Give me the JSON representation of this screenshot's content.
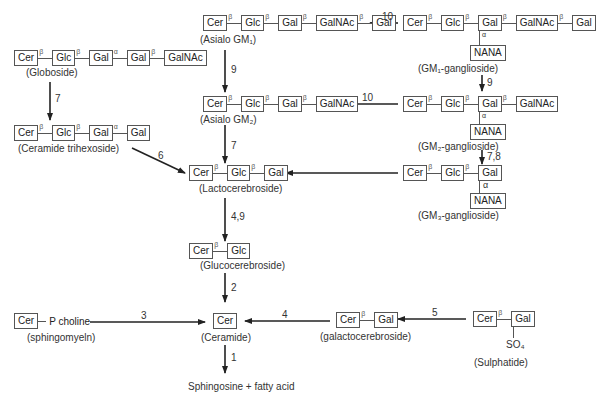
{
  "compounds": {
    "globoside": {
      "units": [
        "Cer",
        "Glc",
        "Gal",
        "Gal",
        "GalNAc"
      ],
      "links": [
        "β",
        "β",
        "α",
        "β"
      ],
      "label": "(Globoside)"
    },
    "ceramide_trihexoside": {
      "units": [
        "Cer",
        "Glc",
        "Gal",
        "Gal"
      ],
      "links": [
        "β",
        "β",
        "α"
      ],
      "label": "(Ceramide trihexoside)"
    },
    "asialo_gm1": {
      "units": [
        "Cer",
        "Glc",
        "Gal",
        "GalNAc",
        "Gal"
      ],
      "links": [
        "β",
        "β",
        "β",
        "β"
      ],
      "label": "(Asialo GM₁)"
    },
    "asialo_gm2": {
      "units": [
        "Cer",
        "Glc",
        "Gal",
        "GalNAc"
      ],
      "links": [
        "β",
        "β",
        "β"
      ],
      "label": "(Asialo GM₂)"
    },
    "gm1": {
      "units": [
        "Cer",
        "Glc",
        "Gal",
        "GalNAc",
        "Gal"
      ],
      "links": [
        "β",
        "β",
        "β",
        "β"
      ],
      "branch": "NANA",
      "branch_link": "α",
      "label": "(GM₁-ganglioside)"
    },
    "gm2": {
      "units": [
        "Cer",
        "Glc",
        "Gal",
        "GalNAc"
      ],
      "links": [
        "β",
        "β",
        "β"
      ],
      "branch": "NANA",
      "branch_link": "α",
      "label": "(GM₂-ganglioside)"
    },
    "gm3": {
      "units": [
        "Cer",
        "Glc",
        "Gal"
      ],
      "links": [
        "β",
        "β"
      ],
      "branch": "NANA",
      "branch_link": "α",
      "label": "(GM₃-ganglioside)"
    },
    "lactocerebroside": {
      "units": [
        "Cer",
        "Glc",
        "Gal"
      ],
      "links": [
        "β",
        "β"
      ],
      "label": "(Lactocerebroside)"
    },
    "glucocerebroside": {
      "units": [
        "Cer",
        "Glc"
      ],
      "links": [
        "β"
      ],
      "label": "(Glucocerebroside)"
    },
    "ceramide": {
      "units": [
        "Cer"
      ],
      "label": "(Ceramide)"
    },
    "sphingomyelin": {
      "units": [
        "Cer"
      ],
      "tail": "P choline",
      "label": "(sphingomyeln)"
    },
    "galactocerebroside": {
      "units": [
        "Cer",
        "Gal"
      ],
      "links": [
        "β"
      ],
      "label": "(galactocerebroside)"
    },
    "sulphatide": {
      "units": [
        "Cer",
        "Gal"
      ],
      "links": [
        "β"
      ],
      "branch": "SO₄",
      "label": "(Sulphatide)"
    },
    "products": {
      "label": "Sphingosine + fatty acid"
    }
  },
  "reactions": [
    {
      "from": "gm1",
      "to": "asialo_gm1",
      "label": "10"
    },
    {
      "from": "asialo_gm1",
      "to": "asialo_gm2",
      "label": "9"
    },
    {
      "from": "gm2",
      "to": "asialo_gm2",
      "label": "10"
    },
    {
      "from": "gm1",
      "to": "gm2",
      "label": "9"
    },
    {
      "from": "gm2",
      "to": "gm3",
      "label": "7,8"
    },
    {
      "from": "globoside",
      "to": "ceramide_trihexoside",
      "label": "7"
    },
    {
      "from": "ceramide_trihexoside",
      "to": "lactocerebroside",
      "label": "6"
    },
    {
      "from": "asialo_gm2",
      "to": "lactocerebroside",
      "label": "7"
    },
    {
      "from": "gm3",
      "to": "lactocerebroside",
      "label": ""
    },
    {
      "from": "lactocerebroside",
      "to": "glucocerebroside",
      "label": "4,9"
    },
    {
      "from": "glucocerebroside",
      "to": "ceramide",
      "label": "2"
    },
    {
      "from": "sphingomyelin",
      "to": "ceramide",
      "label": "3"
    },
    {
      "from": "galactocerebroside",
      "to": "ceramide",
      "label": "4"
    },
    {
      "from": "sulphatide",
      "to": "galactocerebroside",
      "label": "5"
    },
    {
      "from": "ceramide",
      "to": "products",
      "label": "1"
    }
  ]
}
